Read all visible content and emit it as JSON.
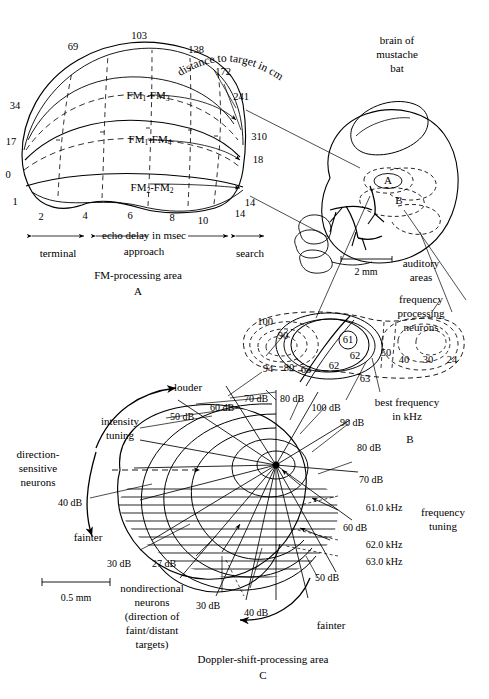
{
  "figure": {
    "title_hidden": "Auditory cortex maps of the mustache bat",
    "panels": [
      {
        "id": "A",
        "caption": "FM-processing area",
        "letter": "A"
      },
      {
        "id": "B",
        "caption": "brain of mustache bat",
        "letter": "B"
      },
      {
        "id": "C",
        "caption": "Doppler-shift-processing area",
        "letter": "C"
      }
    ]
  },
  "panel_a": {
    "caption": "FM-processing area",
    "letter": "A",
    "curved_label": "distance to target in cm",
    "distance_labels": [
      "34",
      "69",
      "103",
      "138",
      "172",
      "241",
      "310",
      "17",
      "0"
    ],
    "left_numbers": [
      "34",
      "17",
      "0",
      "1"
    ],
    "right_numbers": [
      "310",
      "18",
      "14"
    ],
    "top_numbers": [
      "69",
      "103",
      "138",
      "172",
      "241"
    ],
    "axis_numbers": [
      "1",
      "2",
      "4",
      "6",
      "8",
      "10",
      "14"
    ],
    "band_labels": [
      "FM1-FM3",
      "FM1-FM4",
      "FM2-FM2"
    ],
    "bands": [
      {
        "base": "FM",
        "sub1": "1",
        "sep": "-FM",
        "sub2": "3"
      },
      {
        "base": "FM",
        "sub1": "1",
        "sep": "-FM",
        "sub2": "4"
      },
      {
        "base": "FM",
        "sub1": "2",
        "sep": "-FM",
        "sub2": "2"
      }
    ],
    "axis_title": "echo delay in msec",
    "regions": [
      "terminal",
      "approach",
      "search"
    ]
  },
  "panel_b": {
    "letter": "B",
    "brain_label": "brain of mustache bat",
    "brain_label_lines": [
      "brain of",
      "mustache",
      "bat"
    ],
    "region_markers": [
      "A",
      "B"
    ],
    "scale_bar": "2 mm",
    "auditory_label_lines": [
      "auditory",
      "areas"
    ],
    "freq_neurons_lines": [
      "frequency",
      "processing",
      "neurons"
    ],
    "best_freq_lines": [
      "best frequency",
      "in kHz"
    ],
    "contour_numbers_left": [
      "100",
      "90",
      "94",
      "80"
    ],
    "contour_numbers_inner": [
      "63",
      "62",
      "61",
      "62",
      "63"
    ],
    "contour_numbers_right": [
      "50",
      "40",
      "30",
      "24"
    ],
    "circled_value": "61"
  },
  "panel_c": {
    "caption": "Doppler-shift-processing area",
    "letter": "C",
    "louder_label": "louder",
    "fainter_label_left": "fainter",
    "fainter_label_right": "fainter",
    "intensity_tuning_lines": [
      "intensity",
      "tuning"
    ],
    "frequency_tuning_lines": [
      "frequency",
      "tuning"
    ],
    "direction_sensitive_lines": [
      "direction-",
      "sensitive",
      "neurons"
    ],
    "nondirectional_lines": [
      "nondirectional",
      "neurons",
      "(direction of",
      "faint/distant",
      "targets)"
    ],
    "scale_bar": "0.5 mm",
    "db_labels": [
      "50 dB",
      "60 dB",
      "70 dB",
      "80 dB",
      "100 dB",
      "90 dB",
      "80 dB",
      "70 dB",
      "60 dB",
      "40 dB",
      "30 dB",
      "27 dB",
      "30 dB",
      "40 dB",
      "50 dB"
    ],
    "khz_labels": [
      "61.0 kHz",
      "62.0 kHz",
      "63.0 kHz"
    ]
  },
  "colors": {
    "ink": "#000000",
    "paper": "#ffffff",
    "dash": "#333333"
  }
}
